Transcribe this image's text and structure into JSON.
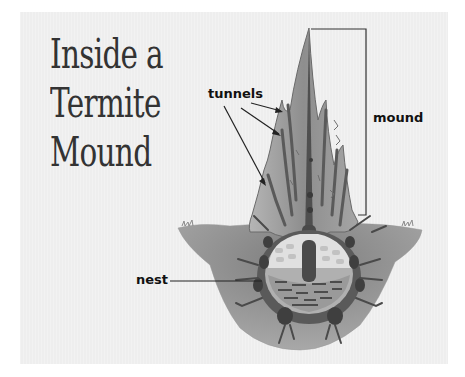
{
  "title": {
    "lines": [
      "Inside a",
      "Termite",
      "Mound"
    ]
  },
  "labels": {
    "tunnels": "tunnels",
    "mound": "mound",
    "nest": "nest"
  },
  "colors": {
    "background": "#eeeeee",
    "ground": "#8a8a8a",
    "mound_body": "#9a9a9a",
    "tunnel": "#4a4a4a",
    "nest_cells": "#e4e4e4",
    "text": "#111111",
    "title_text": "#333333"
  }
}
